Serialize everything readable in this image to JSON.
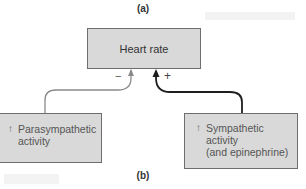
{
  "diagram": {
    "panel_labels": {
      "a": "(a)",
      "b": "(b)"
    },
    "target": {
      "label": "Heart rate"
    },
    "inputs": [
      {
        "id": "parasympathetic",
        "indicator": "↑",
        "label": "Parasympathetic\nactivity",
        "effect_sign": "−",
        "effect": "inhibitory"
      },
      {
        "id": "sympathetic",
        "indicator": "↑",
        "label": "Sympathetic\nactivity\n(and epinephrine)",
        "effect_sign": "+",
        "effect": "excitatory"
      }
    ],
    "colors": {
      "box_fill": "#d9d9d9",
      "box_border": "#6e6e6e",
      "inhibitory_arrow": "#8a8a8a",
      "excitatory_arrow": "#1e1e1e"
    }
  }
}
